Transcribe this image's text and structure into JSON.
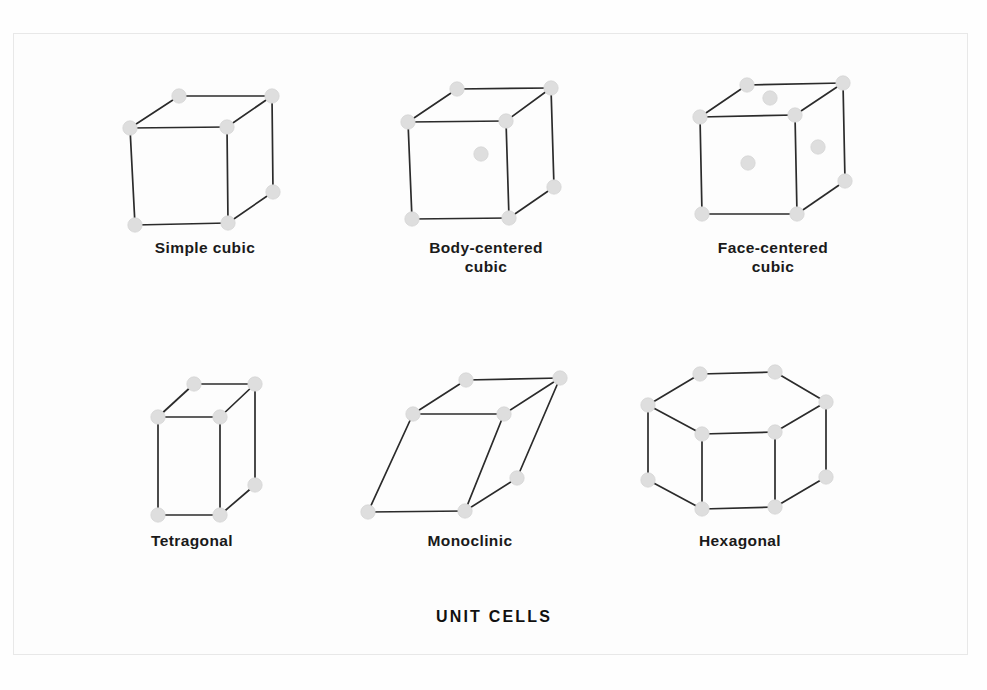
{
  "figure": {
    "caption": "UNIT CELLS",
    "background_color": "#fefefe",
    "frame_color": "#e8e8e8",
    "edge_color": "#2b2b2b",
    "atom_color": "#dedede",
    "label_color": "#1a1a1a"
  },
  "chart_data": {
    "type": "diagram",
    "title": "UNIT CELLS",
    "subtype": "crystal-lattice-unit-cells",
    "legend": "none",
    "grid": false,
    "cells": [
      {
        "id": "simple-cubic",
        "label": "Simple cubic",
        "label_lines": [
          "Simple cubic"
        ],
        "label_center": [
          205,
          253
        ],
        "lattice_points": 8,
        "interior_points": 0,
        "face_points": 0,
        "vertices": {
          "back_top_left": [
            179,
            96
          ],
          "back_top_right": [
            272,
            96
          ],
          "front_top_left": [
            130,
            128
          ],
          "front_top_right": [
            227,
            127
          ],
          "front_bottom_left": [
            135,
            225
          ],
          "front_bottom_right": [
            228,
            223
          ],
          "back_bottom_right": [
            273,
            192
          ],
          "back_bottom_left": [
            180,
            194
          ]
        },
        "visible_atoms": [
          [
            179,
            96
          ],
          [
            272,
            96
          ],
          [
            130,
            128
          ],
          [
            227,
            127
          ],
          [
            135,
            225
          ],
          [
            228,
            223
          ],
          [
            273,
            192
          ]
        ],
        "edges": [
          [
            [
              179,
              96
            ],
            [
              272,
              96
            ]
          ],
          [
            [
              179,
              96
            ],
            [
              130,
              128
            ]
          ],
          [
            [
              272,
              96
            ],
            [
              227,
              127
            ]
          ],
          [
            [
              272,
              96
            ],
            [
              273,
              192
            ]
          ],
          [
            [
              130,
              128
            ],
            [
              227,
              127
            ]
          ],
          [
            [
              130,
              128
            ],
            [
              135,
              225
            ]
          ],
          [
            [
              227,
              127
            ],
            [
              228,
              223
            ]
          ],
          [
            [
              135,
              225
            ],
            [
              228,
              223
            ]
          ],
          [
            [
              228,
              223
            ],
            [
              273,
              192
            ]
          ]
        ]
      },
      {
        "id": "body-centered-cubic",
        "label": "Body-centered cubic",
        "label_lines": [
          "Body-centered",
          "cubic"
        ],
        "label_center": [
          486,
          253
        ],
        "lattice_points": 9,
        "interior_points": 1,
        "face_points": 0,
        "vertices": {
          "back_top_left": [
            457,
            89
          ],
          "back_top_right": [
            551,
            88
          ],
          "front_top_left": [
            408,
            122
          ],
          "front_top_right": [
            506,
            121
          ],
          "front_bottom_left": [
            412,
            219
          ],
          "front_bottom_right": [
            509,
            218
          ],
          "back_bottom_right": [
            554,
            187
          ],
          "back_bottom_left": [
            458,
            188
          ]
        },
        "visible_atoms": [
          [
            457,
            89
          ],
          [
            551,
            88
          ],
          [
            408,
            122
          ],
          [
            506,
            121
          ],
          [
            412,
            219
          ],
          [
            509,
            218
          ],
          [
            554,
            187
          ]
        ],
        "center_atoms": [
          [
            481,
            154
          ]
        ],
        "edges": [
          [
            [
              457,
              89
            ],
            [
              551,
              88
            ]
          ],
          [
            [
              457,
              89
            ],
            [
              408,
              122
            ]
          ],
          [
            [
              551,
              88
            ],
            [
              506,
              121
            ]
          ],
          [
            [
              551,
              88
            ],
            [
              554,
              187
            ]
          ],
          [
            [
              408,
              122
            ],
            [
              506,
              121
            ]
          ],
          [
            [
              408,
              122
            ],
            [
              412,
              219
            ]
          ],
          [
            [
              506,
              121
            ],
            [
              509,
              218
            ]
          ],
          [
            [
              412,
              219
            ],
            [
              509,
              218
            ]
          ],
          [
            [
              509,
              218
            ],
            [
              554,
              187
            ]
          ]
        ]
      },
      {
        "id": "face-centered-cubic",
        "label": "Face-centered cubic",
        "label_lines": [
          "Face-centered",
          "cubic"
        ],
        "label_center": [
          773,
          253
        ],
        "lattice_points": 14,
        "interior_points": 0,
        "face_points": 3,
        "vertices": {
          "back_top_left": [
            747,
            85
          ],
          "back_top_right": [
            843,
            83
          ],
          "front_top_left": [
            700,
            117
          ],
          "front_top_right": [
            795,
            115
          ],
          "front_bottom_left": [
            702,
            214
          ],
          "front_bottom_right": [
            797,
            214
          ],
          "back_bottom_right": [
            845,
            181
          ],
          "back_bottom_left": [
            748,
            182
          ]
        },
        "visible_atoms": [
          [
            747,
            85
          ],
          [
            843,
            83
          ],
          [
            700,
            117
          ],
          [
            795,
            115
          ],
          [
            702,
            214
          ],
          [
            797,
            214
          ],
          [
            845,
            181
          ]
        ],
        "center_atoms": [
          [
            770,
            98
          ],
          [
            748,
            163
          ],
          [
            818,
            147
          ]
        ],
        "edges": [
          [
            [
              747,
              85
            ],
            [
              843,
              83
            ]
          ],
          [
            [
              747,
              85
            ],
            [
              700,
              117
            ]
          ],
          [
            [
              843,
              83
            ],
            [
              795,
              115
            ]
          ],
          [
            [
              843,
              83
            ],
            [
              845,
              181
            ]
          ],
          [
            [
              700,
              117
            ],
            [
              795,
              115
            ]
          ],
          [
            [
              700,
              117
            ],
            [
              702,
              214
            ]
          ],
          [
            [
              795,
              115
            ],
            [
              797,
              214
            ]
          ],
          [
            [
              702,
              214
            ],
            [
              797,
              214
            ]
          ],
          [
            [
              797,
              214
            ],
            [
              845,
              181
            ]
          ]
        ]
      },
      {
        "id": "tetragonal",
        "label": "Tetragonal",
        "label_lines": [
          "Tetragonal"
        ],
        "label_center": [
          192,
          546
        ],
        "lattice_points": 8,
        "interior_points": 0,
        "face_points": 0,
        "vertices": {
          "back_top_left": [
            194,
            384
          ],
          "back_top_right": [
            255,
            384
          ],
          "front_top_left": [
            158,
            417
          ],
          "front_top_right": [
            220,
            417
          ],
          "front_bottom_left": [
            158,
            515
          ],
          "front_bottom_right": [
            220,
            515
          ],
          "back_bottom_right": [
            255,
            485
          ],
          "back_bottom_left": [
            194,
            485
          ]
        },
        "visible_atoms": [
          [
            194,
            384
          ],
          [
            255,
            384
          ],
          [
            158,
            417
          ],
          [
            220,
            417
          ],
          [
            158,
            515
          ],
          [
            220,
            515
          ],
          [
            255,
            485
          ]
        ],
        "edges": [
          [
            [
              194,
              384
            ],
            [
              255,
              384
            ]
          ],
          [
            [
              194,
              384
            ],
            [
              158,
              417
            ]
          ],
          [
            [
              255,
              384
            ],
            [
              220,
              417
            ]
          ],
          [
            [
              255,
              384
            ],
            [
              255,
              485
            ]
          ],
          [
            [
              158,
              417
            ],
            [
              220,
              417
            ]
          ],
          [
            [
              158,
              417
            ],
            [
              158,
              515
            ]
          ],
          [
            [
              220,
              417
            ],
            [
              220,
              515
            ]
          ],
          [
            [
              158,
              515
            ],
            [
              220,
              515
            ]
          ],
          [
            [
              220,
              515
            ],
            [
              255,
              485
            ]
          ]
        ]
      },
      {
        "id": "monoclinic",
        "label": "Monoclinic",
        "label_lines": [
          "Monoclinic"
        ],
        "label_center": [
          470,
          546
        ],
        "lattice_points": 8,
        "interior_points": 0,
        "face_points": 0,
        "vertices": {
          "back_top_left": [
            466,
            380
          ],
          "back_top_right": [
            560,
            378
          ],
          "front_top_left": [
            413,
            414
          ],
          "front_top_right": [
            504,
            414
          ],
          "front_bottom_left": [
            368,
            512
          ],
          "front_bottom_right": [
            465,
            511
          ],
          "back_bottom_right": [
            517,
            478
          ],
          "back_bottom_left": [
            420,
            479
          ]
        },
        "visible_atoms": [
          [
            466,
            380
          ],
          [
            560,
            378
          ],
          [
            413,
            414
          ],
          [
            504,
            414
          ],
          [
            368,
            512
          ],
          [
            465,
            511
          ],
          [
            517,
            478
          ]
        ],
        "edges": [
          [
            [
              466,
              380
            ],
            [
              560,
              378
            ]
          ],
          [
            [
              466,
              380
            ],
            [
              413,
              414
            ]
          ],
          [
            [
              560,
              378
            ],
            [
              504,
              414
            ]
          ],
          [
            [
              560,
              378
            ],
            [
              517,
              478
            ]
          ],
          [
            [
              413,
              414
            ],
            [
              504,
              414
            ]
          ],
          [
            [
              413,
              414
            ],
            [
              368,
              512
            ]
          ],
          [
            [
              504,
              414
            ],
            [
              465,
              511
            ]
          ],
          [
            [
              368,
              512
            ],
            [
              465,
              511
            ]
          ],
          [
            [
              465,
              511
            ],
            [
              517,
              478
            ]
          ]
        ]
      },
      {
        "id": "hexagonal",
        "label": "Hexagonal",
        "label_lines": [
          "Hexagonal"
        ],
        "label_center": [
          740,
          546
        ],
        "lattice_points": 12,
        "interior_points": 0,
        "face_points": 0,
        "top_hexagon": [
          [
            700,
            374
          ],
          [
            775,
            372
          ],
          [
            826,
            402
          ],
          [
            775,
            432
          ],
          [
            702,
            434
          ],
          [
            648,
            405
          ]
        ],
        "bottom_hexagon": [
          [
            700,
            449
          ],
          [
            775,
            447
          ],
          [
            826,
            477
          ],
          [
            775,
            507
          ],
          [
            702,
            509
          ],
          [
            648,
            480
          ]
        ],
        "visible_atoms": [
          [
            700,
            374
          ],
          [
            775,
            372
          ],
          [
            826,
            402
          ],
          [
            775,
            432
          ],
          [
            702,
            434
          ],
          [
            648,
            405
          ],
          [
            826,
            477
          ],
          [
            775,
            507
          ],
          [
            702,
            509
          ],
          [
            648,
            480
          ]
        ],
        "edges": [
          [
            [
              700,
              374
            ],
            [
              775,
              372
            ]
          ],
          [
            [
              775,
              372
            ],
            [
              826,
              402
            ]
          ],
          [
            [
              826,
              402
            ],
            [
              775,
              432
            ]
          ],
          [
            [
              775,
              432
            ],
            [
              702,
              434
            ]
          ],
          [
            [
              702,
              434
            ],
            [
              648,
              405
            ]
          ],
          [
            [
              648,
              405
            ],
            [
              700,
              374
            ]
          ],
          [
            [
              648,
              405
            ],
            [
              648,
              480
            ]
          ],
          [
            [
              702,
              434
            ],
            [
              702,
              509
            ]
          ],
          [
            [
              775,
              432
            ],
            [
              775,
              507
            ]
          ],
          [
            [
              826,
              402
            ],
            [
              826,
              477
            ]
          ],
          [
            [
              648,
              480
            ],
            [
              702,
              509
            ]
          ],
          [
            [
              702,
              509
            ],
            [
              775,
              507
            ]
          ],
          [
            [
              775,
              507
            ],
            [
              826,
              477
            ]
          ]
        ]
      }
    ],
    "caption_position": [
      494,
      622
    ]
  }
}
